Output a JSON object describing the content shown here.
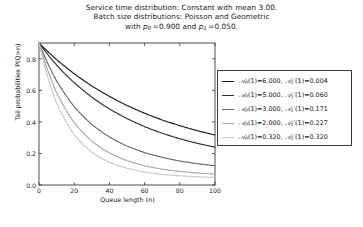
{
  "chart_data": {
    "type": "line",
    "title_lines": [
      "Service time distribution: Constant with mean 3.00.",
      "Batch size distributions: Poisson and Geometric",
      "with p0 =0.900 and p1 =0.050."
    ],
    "xlabel": "Queue length (n)",
    "ylabel": "Tail probabilities P(Q>n)",
    "xlim": [
      0,
      100
    ],
    "ylim": [
      0.0,
      0.9
    ],
    "xticks": [
      0,
      20,
      40,
      60,
      80,
      100
    ],
    "xtick_labels": [
      "0",
      "20",
      "40",
      "60",
      "80",
      "100"
    ],
    "yticks": [
      0.0,
      0.2,
      0.4,
      0.6,
      0.8
    ],
    "ytick_labels": [
      "0.0",
      "0.2",
      "0.4",
      "0.6",
      "0.8"
    ],
    "grid": false,
    "legend_position": "right",
    "x": [
      0,
      10,
      20,
      30,
      40,
      50,
      60,
      70,
      80,
      90,
      100
    ],
    "series": [
      {
        "name": "A0(1)=6.000, A1'(1)=0.004",
        "label_a0": "6.000",
        "label_a1": "0.004",
        "color": "#1c1c1c",
        "values": [
          0.9,
          0.795,
          0.705,
          0.628,
          0.562,
          0.504,
          0.455,
          0.412,
          0.376,
          0.344,
          0.317
        ]
      },
      {
        "name": "A0(1)=5.000, A1'(1)=0.060",
        "label_a0": "5.000",
        "label_a1": "0.060",
        "color": "#2e2e2e",
        "values": [
          0.9,
          0.76,
          0.648,
          0.557,
          0.482,
          0.421,
          0.37,
          0.328,
          0.293,
          0.264,
          0.24
        ]
      },
      {
        "name": "A0(1)=3.000, A1'(1)=0.171",
        "label_a0": "3.000",
        "label_a1": "0.171",
        "color": "#6a6a6a",
        "values": [
          0.9,
          0.66,
          0.497,
          0.384,
          0.304,
          0.247,
          0.205,
          0.175,
          0.152,
          0.135,
          0.122
        ]
      },
      {
        "name": "A0(1)=2.000, A1'(1)=0.227",
        "label_a0": "2.000",
        "label_a1": "0.227",
        "color": "#a8a8a8",
        "values": [
          0.9,
          0.585,
          0.396,
          0.278,
          0.203,
          0.154,
          0.122,
          0.1,
          0.086,
          0.076,
          0.069
        ]
      },
      {
        "name": "A0(1)=0.320, A1'(1)=0.320",
        "label_a0": "0.320",
        "label_a1": "0.320",
        "color": "#c9c9c9",
        "values": [
          0.9,
          0.52,
          0.32,
          0.208,
          0.144,
          0.106,
          0.082,
          0.067,
          0.058,
          0.052,
          0.048
        ]
      }
    ]
  }
}
